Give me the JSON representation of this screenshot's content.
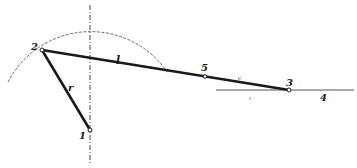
{
  "diagram": {
    "type": "crank-slider linkage",
    "colors": {
      "ink": "#1a1a1a",
      "guide": "#555555",
      "axis": "#666666",
      "background": "#ffffff"
    },
    "points": [
      {
        "id": "1",
        "label": "1",
        "role": "crank pivot"
      },
      {
        "id": "2",
        "label": "2",
        "role": "crank pin"
      },
      {
        "id": "3",
        "label": "3",
        "role": "slider"
      },
      {
        "id": "5",
        "label": "5",
        "role": "point on coupler"
      }
    ],
    "links": [
      {
        "from": "1",
        "to": "2",
        "label": "r"
      },
      {
        "from": "2",
        "to": "3",
        "label": "l"
      }
    ],
    "annotations": {
      "guide_label": "4",
      "coupler_mark": "c",
      "guide_tick": "ı"
    }
  }
}
